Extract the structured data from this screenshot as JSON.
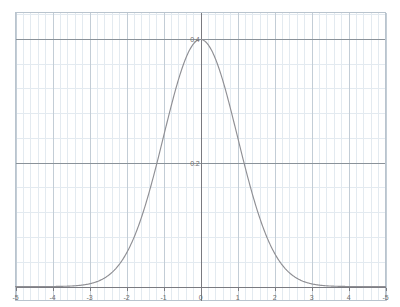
{
  "chart_data": {
    "type": "line",
    "title": "",
    "subtitle": "",
    "xlabel": "",
    "ylabel": "",
    "xlim": [
      -5,
      5
    ],
    "ylim": [
      -0.0225,
      0.4425
    ],
    "grid": true,
    "legend": null,
    "background": "#ffffff",
    "curve_color": "#8f8f94",
    "axis_color": "#7a7a80",
    "major_grid_color": "#c3cdd6",
    "minor_grid_color": "#e3eaf0",
    "border_color": "#b9c4ce",
    "label_color": "#6e6e6e",
    "function": "standard normal probability density",
    "peak": {
      "x": 0,
      "y": 0.3989
    },
    "xticks": [
      -5,
      -4,
      -3,
      -2,
      -1,
      0,
      1,
      2,
      3,
      4,
      5
    ],
    "xtick_labels": [
      "-5",
      "-4",
      "-3",
      "-2",
      "-1",
      "0",
      "1",
      "2",
      "3",
      "4",
      "-5"
    ],
    "yticks": [
      0.2,
      0.4
    ],
    "ytick_labels": [
      "0.2",
      "0.4"
    ],
    "minor_x_step": 0.2,
    "minor_y_step": 0.04,
    "x": [
      -5,
      -4.8,
      -4.6,
      -4.4,
      -4.2,
      -4,
      -3.8,
      -3.6,
      -3.4,
      -3.2,
      -3,
      -2.8,
      -2.6,
      -2.4,
      -2.2,
      -2,
      -1.8,
      -1.6,
      -1.4,
      -1.2,
      -1,
      -0.8,
      -0.6,
      -0.4,
      -0.2,
      0,
      0.2,
      0.4,
      0.6,
      0.8,
      1,
      1.2,
      1.4,
      1.6,
      1.8,
      2,
      2.2,
      2.4,
      2.6,
      2.8,
      3,
      3.2,
      3.4,
      3.6,
      3.8,
      4,
      4.2,
      4.4,
      4.6,
      4.8,
      5
    ],
    "y": [
      1.5e-06,
      4e-06,
      1.02e-05,
      2.49e-05,
      5.89e-05,
      0.0001338,
      0.0002919,
      0.0006119,
      0.0012322,
      0.0023841,
      0.0044318,
      0.0079155,
      0.013583,
      0.0223945,
      0.0354746,
      0.053991,
      0.0789502,
      0.1109208,
      0.1497275,
      0.1941861,
      0.2419707,
      0.2896916,
      0.3332246,
      0.3682701,
      0.3910427,
      0.3989423,
      0.3910427,
      0.3682701,
      0.3332246,
      0.2896916,
      0.2419707,
      0.1941861,
      0.1497275,
      0.1109208,
      0.0789502,
      0.053991,
      0.0354746,
      0.0223945,
      0.013583,
      0.0079155,
      0.0044318,
      0.0023841,
      0.0012322,
      0.0006119,
      0.0002919,
      0.0001338,
      5.89e-05,
      2.49e-05,
      1.02e-05,
      4e-06,
      1.5e-06
    ]
  },
  "labels": {
    "x": [
      "-5",
      "-4",
      "-3",
      "-2",
      "-1",
      "0",
      "1",
      "2",
      "3",
      "4",
      "-5"
    ],
    "y": [
      "0.2",
      "0.4"
    ]
  }
}
